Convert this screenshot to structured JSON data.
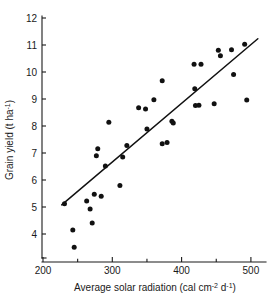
{
  "chart_data": {
    "type": "scatter",
    "title": "",
    "xlabel": "Average solar radiation (cal cm⁻² d⁻¹)",
    "ylabel": "Grain yield (t ha⁻¹)",
    "xlabel_parts": {
      "main": "Average solar radiation (cal cm",
      "sup1": "-2",
      "mid": " d",
      "sup2": "-1",
      "tail": ")"
    },
    "ylabel_parts": {
      "main": "Grain yield (t ha",
      "sup1": "-1",
      "tail": ")"
    },
    "xlim": [
      195,
      515
    ],
    "ylim": [
      3.2,
      12.0
    ],
    "xticks": [
      200,
      300,
      400,
      500
    ],
    "xticks_minor": [
      250,
      350,
      450
    ],
    "yticks": [
      4,
      5,
      6,
      7,
      8,
      9,
      10,
      11,
      12
    ],
    "xtick_labels": [
      "200",
      "300",
      "400",
      "500"
    ],
    "ytick_labels": [
      "4",
      "5",
      "6",
      "7",
      "8",
      "9",
      "10",
      "11",
      "12"
    ],
    "grid": false,
    "legend": null,
    "marker": "filled-circle",
    "marker_color": "#111111",
    "line_color": "#111111",
    "points": [
      [
        231,
        5.12
      ],
      [
        243,
        4.15
      ],
      [
        245,
        3.51
      ],
      [
        263,
        5.22
      ],
      [
        268,
        4.93
      ],
      [
        271,
        4.41
      ],
      [
        274,
        5.47
      ],
      [
        277,
        6.9
      ],
      [
        279,
        7.16
      ],
      [
        284,
        5.4
      ],
      [
        290,
        6.52
      ],
      [
        295,
        8.14
      ],
      [
        311,
        5.8
      ],
      [
        315,
        6.85
      ],
      [
        321,
        7.28
      ],
      [
        338,
        8.68
      ],
      [
        348,
        8.63
      ],
      [
        350,
        7.89
      ],
      [
        360,
        8.97
      ],
      [
        372,
        7.34
      ],
      [
        379,
        7.39
      ],
      [
        386,
        8.18
      ],
      [
        388,
        8.11
      ],
      [
        418,
        10.29
      ],
      [
        419,
        9.38
      ],
      [
        420,
        8.76
      ],
      [
        425,
        8.77
      ],
      [
        428,
        10.29
      ],
      [
        372,
        9.68
      ],
      [
        447,
        8.82
      ],
      [
        453,
        10.81
      ],
      [
        456,
        10.6
      ],
      [
        472,
        10.82
      ],
      [
        475,
        9.91
      ],
      [
        491,
        11.03
      ],
      [
        494,
        8.96
      ]
    ],
    "fit_line": {
      "x_start": 227,
      "y_start": 5.08,
      "x_end": 510,
      "y_end": 11.23
    }
  }
}
